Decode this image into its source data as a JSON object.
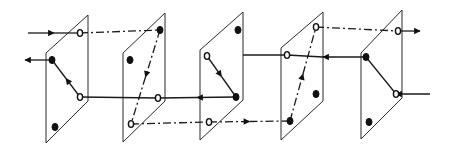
{
  "figure": {
    "type": "diagram",
    "width": 453,
    "height": 152,
    "colors": {
      "background": "#ffffff",
      "ink": "#1a1a1a"
    },
    "line_styles": [
      "solid",
      "dash-dot"
    ],
    "planes": [
      {
        "id": "plane-1",
        "corners": [
          [
            46,
            53
          ],
          [
            88,
            15
          ],
          [
            88,
            101
          ],
          [
            46,
            143
          ]
        ],
        "nodes": [
          {
            "x": 80,
            "y": 33,
            "type": "open"
          },
          {
            "x": 52,
            "y": 60,
            "type": "filled"
          },
          {
            "x": 80,
            "y": 97,
            "type": "open"
          },
          {
            "x": 55,
            "y": 127,
            "type": "filled"
          }
        ]
      },
      {
        "id": "plane-2",
        "corners": [
          [
            123,
            53
          ],
          [
            165,
            13
          ],
          [
            165,
            101
          ],
          [
            123,
            142
          ]
        ],
        "nodes": [
          {
            "x": 160,
            "y": 30,
            "type": "filled"
          },
          {
            "x": 130,
            "y": 60,
            "type": "filled"
          },
          {
            "x": 158,
            "y": 98,
            "type": "open"
          },
          {
            "x": 131,
            "y": 124,
            "type": "open"
          }
        ]
      },
      {
        "id": "plane-3",
        "corners": [
          [
            200,
            50
          ],
          [
            243,
            12
          ],
          [
            243,
            100
          ],
          [
            200,
            140
          ]
        ],
        "nodes": [
          {
            "x": 238,
            "y": 30,
            "type": "filled"
          },
          {
            "x": 207,
            "y": 56,
            "type": "open"
          },
          {
            "x": 236,
            "y": 97,
            "type": "filled"
          },
          {
            "x": 209,
            "y": 122,
            "type": "open"
          }
        ]
      },
      {
        "id": "plane-4",
        "corners": [
          [
            281,
            48
          ],
          [
            323,
            12
          ],
          [
            323,
            101
          ],
          [
            281,
            140
          ]
        ],
        "nodes": [
          {
            "x": 316,
            "y": 27,
            "type": "open"
          },
          {
            "x": 287,
            "y": 55,
            "type": "open"
          },
          {
            "x": 316,
            "y": 94,
            "type": "filled"
          },
          {
            "x": 290,
            "y": 121,
            "type": "filled"
          }
        ]
      },
      {
        "id": "plane-5",
        "corners": [
          [
            361,
            53
          ],
          [
            402,
            10
          ],
          [
            402,
            98
          ],
          [
            361,
            139
          ]
        ],
        "nodes": [
          {
            "x": 398,
            "y": 31,
            "type": "open"
          },
          {
            "x": 366,
            "y": 57,
            "type": "filled"
          },
          {
            "x": 396,
            "y": 94,
            "type": "open"
          },
          {
            "x": 369,
            "y": 122,
            "type": "filled"
          }
        ]
      }
    ],
    "connections": [
      {
        "from": [
          28,
          33
        ],
        "to": [
          80,
          33
        ],
        "style": "solid",
        "arrow": "mid-forward",
        "note": "input arrow into plane 1 upper open node"
      },
      {
        "from": [
          80,
          33
        ],
        "to": [
          160,
          30
        ],
        "style": "dash-dot",
        "arrow": "none"
      },
      {
        "from": [
          160,
          30
        ],
        "to": [
          131,
          124
        ],
        "style": "dash-dot",
        "arrow": "mid-forward"
      },
      {
        "from": [
          131,
          124
        ],
        "to": [
          209,
          122
        ],
        "style": "dash-dot",
        "arrow": "none"
      },
      {
        "from": [
          209,
          122
        ],
        "to": [
          290,
          121
        ],
        "style": "dash-dot",
        "arrow": "mid-forward"
      },
      {
        "from": [
          290,
          121
        ],
        "to": [
          316,
          27
        ],
        "style": "dash-dot",
        "arrow": "mid-forward"
      },
      {
        "from": [
          316,
          27
        ],
        "to": [
          398,
          31
        ],
        "style": "dash-dot",
        "arrow": "none"
      },
      {
        "from": [
          398,
          31
        ],
        "to": [
          420,
          31
        ],
        "style": "solid",
        "arrow": "end",
        "note": "output arrow"
      },
      {
        "from": [
          430,
          94
        ],
        "to": [
          396,
          94
        ],
        "style": "solid",
        "arrow": "end",
        "note": "input arrow into plane 5 lower open node"
      },
      {
        "from": [
          396,
          94
        ],
        "to": [
          366,
          57
        ],
        "style": "solid",
        "arrow": "none"
      },
      {
        "from": [
          366,
          57
        ],
        "to": [
          323,
          57
        ],
        "style": "solid",
        "arrow": "end"
      },
      {
        "from": [
          323,
          57
        ],
        "to": [
          287,
          55
        ],
        "style": "solid",
        "arrow": "none",
        "note": "hidden behind plane"
      },
      {
        "from": [
          287,
          55
        ],
        "to": [
          243,
          55
        ],
        "style": "solid",
        "arrow": "none"
      },
      {
        "from": [
          207,
          56
        ],
        "to": [
          236,
          97
        ],
        "style": "solid",
        "arrow": "mid-forward"
      },
      {
        "from": [
          236,
          97
        ],
        "to": [
          158,
          98
        ],
        "style": "solid",
        "arrow": "mid-forward"
      },
      {
        "from": [
          158,
          98
        ],
        "to": [
          80,
          97
        ],
        "style": "solid",
        "arrow": "none"
      },
      {
        "from": [
          80,
          97
        ],
        "to": [
          52,
          60
        ],
        "style": "solid",
        "arrow": "mid-forward"
      },
      {
        "from": [
          52,
          60
        ],
        "to": [
          25,
          60
        ],
        "style": "solid",
        "arrow": "end",
        "note": "output arrow"
      }
    ],
    "labels": []
  }
}
